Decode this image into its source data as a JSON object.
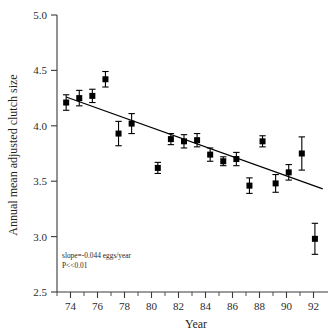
{
  "figure": {
    "background_color": "#ffffff",
    "ink_color": "#000000"
  },
  "chart_data": {
    "type": "scatter",
    "title": "",
    "xlabel": "Year",
    "ylabel": "Annual mean adjusted clutch size",
    "xlim": [
      72.3,
      93.0
    ],
    "ylim": [
      2.5,
      5.0
    ],
    "grid": false,
    "legend": null,
    "x_major_ticks": [
      74,
      76,
      78,
      80,
      82,
      84,
      86,
      88,
      90,
      92
    ],
    "x_major_tick_labels": [
      "74",
      "76",
      "78",
      "80",
      "82",
      "84",
      "86",
      "88",
      "90",
      "92"
    ],
    "x_minor_ticks": [
      73,
      75,
      77,
      79,
      81,
      83,
      85,
      87,
      89,
      91
    ],
    "y_major_ticks": [
      2.5,
      3.0,
      3.5,
      4.0,
      4.5,
      5.0
    ],
    "y_major_tick_labels": [
      "2.5",
      "3.0",
      "3.5",
      "4.0",
      "4.5",
      "5.0"
    ],
    "marker": "filled-square",
    "error_bar_type": "standard-error",
    "x": [
      73,
      74,
      75,
      76,
      77,
      78,
      80,
      81,
      82,
      83,
      84,
      85,
      86,
      87,
      88,
      89,
      90,
      91,
      92
    ],
    "values": [
      4.21,
      4.25,
      4.27,
      4.42,
      3.93,
      4.02,
      3.62,
      3.88,
      3.86,
      3.87,
      3.74,
      3.68,
      3.7,
      3.46,
      3.86,
      3.48,
      3.58,
      3.75,
      2.98
    ],
    "y_err_low": [
      0.07,
      0.07,
      0.06,
      0.07,
      0.11,
      0.09,
      0.05,
      0.05,
      0.06,
      0.06,
      0.06,
      0.04,
      0.06,
      0.07,
      0.05,
      0.08,
      0.07,
      0.15,
      0.14
    ],
    "y_err_high": [
      0.07,
      0.07,
      0.06,
      0.07,
      0.11,
      0.09,
      0.05,
      0.05,
      0.06,
      0.06,
      0.06,
      0.04,
      0.06,
      0.07,
      0.05,
      0.08,
      0.07,
      0.15,
      0.14
    ],
    "points": [
      {
        "x": 73,
        "y": 4.21,
        "err": 0.07
      },
      {
        "x": 74,
        "y": 4.25,
        "err": 0.07
      },
      {
        "x": 75,
        "y": 4.27,
        "err": 0.06
      },
      {
        "x": 76,
        "y": 4.42,
        "err": 0.07
      },
      {
        "x": 77,
        "y": 3.93,
        "err": 0.11
      },
      {
        "x": 78,
        "y": 4.02,
        "err": 0.09
      },
      {
        "x": 80,
        "y": 3.62,
        "err": 0.05
      },
      {
        "x": 81,
        "y": 3.88,
        "err": 0.05
      },
      {
        "x": 82,
        "y": 3.86,
        "err": 0.06
      },
      {
        "x": 83,
        "y": 3.87,
        "err": 0.06
      },
      {
        "x": 84,
        "y": 3.74,
        "err": 0.06
      },
      {
        "x": 85,
        "y": 3.68,
        "err": 0.04
      },
      {
        "x": 86,
        "y": 3.7,
        "err": 0.06
      },
      {
        "x": 87,
        "y": 3.46,
        "err": 0.07
      },
      {
        "x": 88,
        "y": 3.86,
        "err": 0.05
      },
      {
        "x": 89,
        "y": 3.48,
        "err": 0.08
      },
      {
        "x": 90,
        "y": 3.58,
        "err": 0.07
      },
      {
        "x": 91,
        "y": 3.75,
        "err": 0.15
      },
      {
        "x": 92,
        "y": 2.98,
        "err": 0.14
      }
    ],
    "fit_line": {
      "x_start": 73.0,
      "x_end": 92.6,
      "y_start": 4.26,
      "y_end": 3.43,
      "slope": -0.044,
      "intercept_label": "slope=-0.044 eggs/year"
    },
    "annotations": [
      {
        "name": "slope-annotation",
        "text": "slope=-0.044 eggs/year"
      },
      {
        "name": "pvalue-annotation",
        "text": "P<<0.01"
      }
    ]
  },
  "caption_fragment": "​"
}
